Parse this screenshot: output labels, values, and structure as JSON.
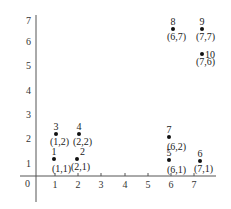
{
  "diagram": {
    "x_axis": {
      "ticks": [
        {
          "label": "1",
          "px": 55
        },
        {
          "label": "2",
          "px": 78
        },
        {
          "label": "3",
          "px": 101
        },
        {
          "label": "4",
          "px": 125
        },
        {
          "label": "5",
          "px": 148
        },
        {
          "label": "6",
          "px": 171
        },
        {
          "label": "7",
          "px": 194
        }
      ]
    },
    "y_axis": {
      "ticks": [
        {
          "label": "7",
          "py": 20
        },
        {
          "label": "6",
          "py": 41
        },
        {
          "label": "5",
          "py": 65
        },
        {
          "label": "4",
          "py": 90
        },
        {
          "label": "3",
          "py": 114
        },
        {
          "label": "2",
          "py": 138
        },
        {
          "label": "1",
          "py": 163
        }
      ],
      "origin_label": "0"
    },
    "points": [
      {
        "id": "1",
        "coord": "(1,1)",
        "dx": 54,
        "dy": 159,
        "num_pos": "above",
        "coord_pos": "below-right"
      },
      {
        "id": "2",
        "coord": "(2,1)",
        "dx": 77,
        "dy": 159,
        "num_pos": "above-right",
        "coord_pos": "below"
      },
      {
        "id": "3",
        "coord": "(1,2)",
        "dx": 56,
        "dy": 134,
        "num_pos": "above",
        "coord_pos": "below"
      },
      {
        "id": "4",
        "coord": "(2,2)",
        "dx": 79,
        "dy": 134,
        "num_pos": "above",
        "coord_pos": "below"
      },
      {
        "id": "5",
        "coord": "(6,1)",
        "dx": 169,
        "dy": 160,
        "num_pos": "above",
        "coord_pos": "below-right"
      },
      {
        "id": "6",
        "coord": "(7,1)",
        "dx": 200,
        "dy": 161,
        "num_pos": "above",
        "coord_pos": "below"
      },
      {
        "id": "7",
        "coord": "(6,2)",
        "dx": 169,
        "dy": 137,
        "num_pos": "above",
        "coord_pos": "below-right"
      },
      {
        "id": "8",
        "coord": "(6,7)",
        "dx": 173,
        "dy": 29,
        "num_pos": "above",
        "coord_pos": "below"
      },
      {
        "id": "9",
        "coord": "(7,7)",
        "dx": 202,
        "dy": 29,
        "num_pos": "above",
        "coord_pos": "below"
      },
      {
        "id": "10",
        "coord": "(7,6)",
        "dx": 202,
        "dy": 54,
        "num_pos": "right",
        "coord_pos": "below"
      }
    ]
  }
}
